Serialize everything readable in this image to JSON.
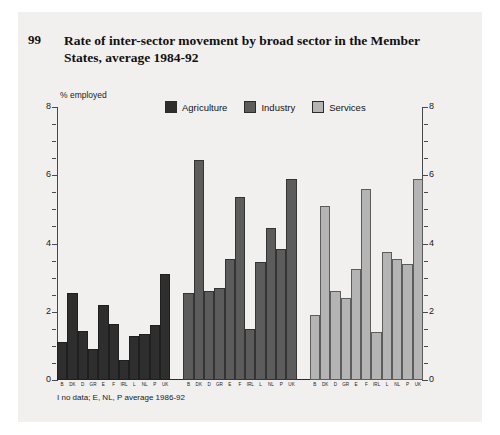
{
  "figure": {
    "number": "99",
    "title": "Rate of inter-sector movement by broad sector in the Member States, average 1984-92",
    "footnote": "I no data; E, NL, P average 1986-92"
  },
  "colors": {
    "agriculture": "#2e2e2e",
    "industry": "#5c5c5c",
    "services": "#b4b4b4",
    "panel": "#f1f0ee",
    "axis": "#4a4a4a"
  },
  "chart_data": {
    "type": "bar",
    "title": "Rate of inter-sector movement by broad sector in the Member States, average 1984-92",
    "xlabel": "",
    "ylabel": "% employed",
    "ylim": [
      0,
      8
    ],
    "yticks": [
      0,
      2,
      4,
      6,
      8
    ],
    "grid": false,
    "legend_position": "top-center",
    "dual_axis": true,
    "categories": [
      "B",
      "DK",
      "D",
      "GR",
      "E",
      "F",
      "IRL",
      "L",
      "NL",
      "P",
      "UK"
    ],
    "series": [
      {
        "name": "Agriculture",
        "color": "#2e2e2e",
        "values": [
          1.1,
          2.55,
          1.45,
          0.9,
          2.2,
          1.65,
          0.6,
          1.3,
          1.35,
          1.6,
          3.1
        ]
      },
      {
        "name": "Industry",
        "color": "#5c5c5c",
        "values": [
          2.55,
          6.45,
          2.6,
          2.7,
          3.55,
          5.35,
          1.5,
          3.45,
          4.45,
          3.85,
          5.9
        ]
      },
      {
        "name": "Services",
        "color": "#b4b4b4",
        "values": [
          1.9,
          5.1,
          2.6,
          2.4,
          3.25,
          5.6,
          1.4,
          3.75,
          3.55,
          3.4,
          5.9
        ]
      }
    ],
    "annotations": [
      "I no data; E, NL, P average 1986-92"
    ]
  }
}
